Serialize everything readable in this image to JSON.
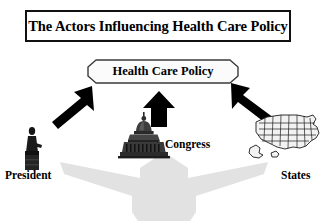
{
  "diagram": {
    "title": "The Actors Influencing Health Care Policy",
    "center_node": {
      "label": "Health Care Policy",
      "shape": "chamfered-rounded-rectangle",
      "fill": "#fbfbfb",
      "stroke": "#3a3a3a"
    },
    "actors": [
      {
        "id": "president",
        "label": "President",
        "icon": "president-podium-silhouette-icon",
        "position": "left",
        "arrow": {
          "name": "arrow-up-right-icon",
          "direction": "up-right",
          "color": "#000000"
        }
      },
      {
        "id": "congress",
        "label": "Congress",
        "icon": "capitol-dome-icon",
        "position": "center",
        "arrow": {
          "name": "arrow-up-icon",
          "direction": "up",
          "color": "#000000"
        }
      },
      {
        "id": "states",
        "label": "States",
        "icon": "united-states-map-icon",
        "position": "right",
        "arrow": {
          "name": "arrow-up-left-icon",
          "direction": "up-left",
          "color": "#000000"
        }
      }
    ],
    "background_arrow": {
      "name": "converging-upward-arrow-icon",
      "color": "#e2e2e2"
    },
    "colors": {
      "background": "#ffffff",
      "ink": "#000000",
      "title_border": "#111111",
      "gray_arrow": "#e2e2e2"
    }
  }
}
